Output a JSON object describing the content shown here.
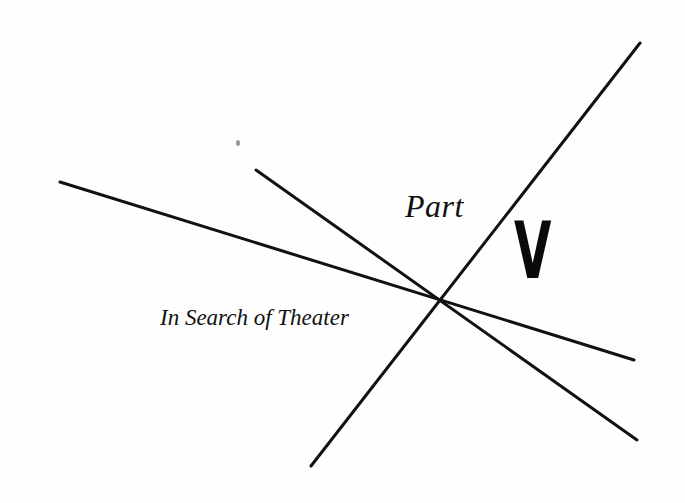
{
  "page": {
    "part_label": "Part",
    "part_number": "V",
    "title": "In Search of Theater"
  },
  "colors": {
    "background": "#fefefe",
    "ink": "#111111"
  },
  "graphic": {
    "lines": [
      {
        "x1": 60,
        "y1": 182,
        "x2": 634,
        "y2": 360
      },
      {
        "x1": 256,
        "y1": 170,
        "x2": 637,
        "y2": 440
      },
      {
        "x1": 640,
        "y1": 43,
        "x2": 311,
        "y2": 466
      }
    ],
    "intersection": {
      "x": 440,
      "y": 300
    }
  }
}
